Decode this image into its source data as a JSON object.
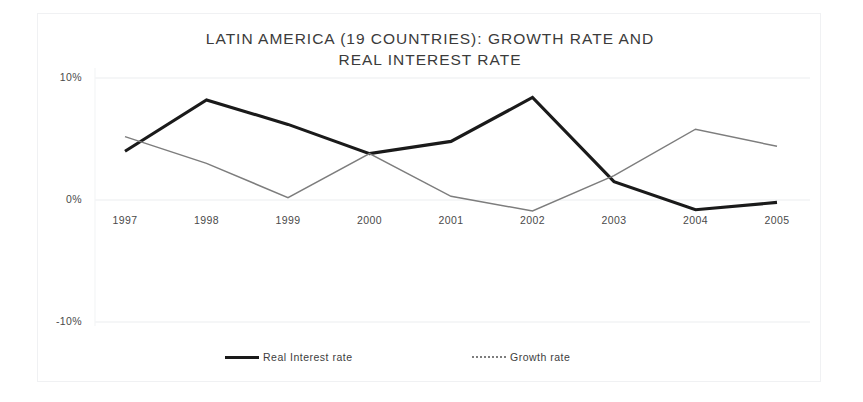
{
  "chart_data": {
    "type": "line",
    "title": "LATIN AMERICA (19 COUNTRIES): GROWTH RATE AND\nREAL INTEREST RATE",
    "xlabel": "",
    "ylabel": "",
    "categories": [
      "1997",
      "1998",
      "1999",
      "2000",
      "2001",
      "2002",
      "2003",
      "2004",
      "2005"
    ],
    "ylim": [
      -10,
      10
    ],
    "yticks": [
      "10%",
      "0%",
      "-10%"
    ],
    "ytick_values": [
      10,
      0,
      -10
    ],
    "grid": true,
    "legend_position": "bottom",
    "series": [
      {
        "name": "Real Interest rate",
        "style": "thick-solid-black",
        "color": "#1a1a1a",
        "values": [
          4.0,
          8.2,
          6.2,
          3.8,
          4.8,
          8.4,
          1.5,
          -0.8,
          -0.2
        ]
      },
      {
        "name": "Growth rate",
        "style": "thin-gray",
        "color": "#7d7d7d",
        "values": [
          5.2,
          3.0,
          0.2,
          3.8,
          0.3,
          -0.9,
          2.0,
          5.8,
          4.4
        ]
      }
    ]
  },
  "legend": {
    "items": [
      {
        "label": "Real Interest rate"
      },
      {
        "label": "Growth rate"
      }
    ]
  }
}
